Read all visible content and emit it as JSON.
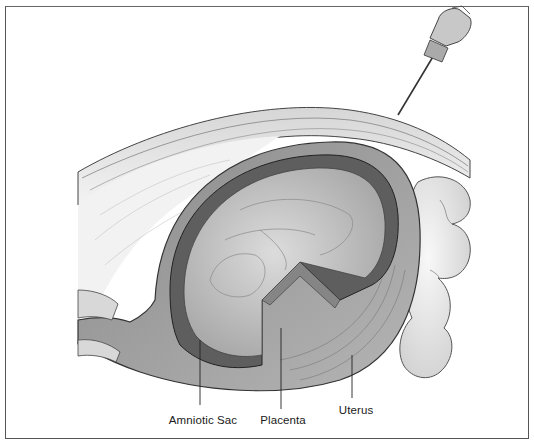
{
  "figure": {
    "labels": [
      {
        "id": "amniotic-sac",
        "text": "Amniotic Sac",
        "x": 203,
        "y": 414,
        "line_x": 200,
        "line_y1": 340,
        "line_y2": 405
      },
      {
        "id": "placenta",
        "text": "Placenta",
        "x": 283,
        "y": 414,
        "line_x": 281,
        "line_y1": 328,
        "line_y2": 409
      },
      {
        "id": "uterus",
        "text": "Uterus",
        "x": 356,
        "y": 404,
        "line_x": 352,
        "line_y1": 355,
        "line_y2": 398
      }
    ],
    "colors": {
      "frame": "#555555",
      "ink": "#1a1a1a",
      "skin": "#e4e4e4",
      "uterine_wall": "#9a9a9a",
      "placenta": "#5e5e5e",
      "sac_fluid": "#c8c8c8",
      "intestine": "#ececec"
    }
  }
}
